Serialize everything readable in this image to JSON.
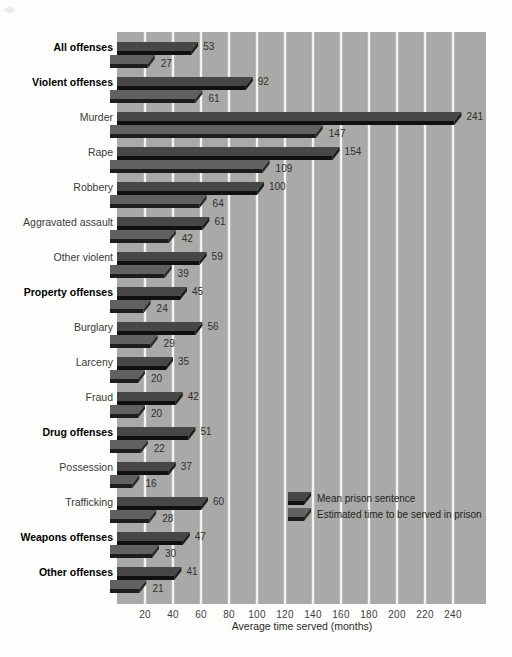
{
  "chart_data": {
    "type": "bar",
    "orientation": "horizontal",
    "title": "",
    "xlabel": "Average time served (months)",
    "x_ticks": [
      20,
      40,
      60,
      80,
      100,
      120,
      140,
      160,
      180,
      200,
      220,
      240
    ],
    "xlim": [
      0,
      264
    ],
    "grid": {
      "axis": "x",
      "style": "white vertical gridlines on gray panel"
    },
    "legend": {
      "position": "inside-right",
      "entries": [
        "Mean prison sentence",
        "Estimated time to be served in prison"
      ]
    },
    "categories": [
      "All offenses",
      "Violent offenses",
      "Murder",
      "Rape",
      "Robbery",
      "Aggravated assault",
      "Other violent",
      "Property offenses",
      "Burglary",
      "Larceny",
      "Fraud",
      "Drug offenses",
      "Possession",
      "Trafficking",
      "Weapons offenses",
      "Other offenses"
    ],
    "bold": [
      true,
      true,
      false,
      false,
      false,
      false,
      false,
      true,
      false,
      false,
      false,
      true,
      false,
      false,
      true,
      true
    ],
    "series": [
      {
        "name": "Mean prison sentence",
        "values": [
          53,
          92,
          241,
          154,
          100,
          61,
          59,
          45,
          56,
          35,
          42,
          51,
          37,
          60,
          47,
          41
        ]
      },
      {
        "name": "Estimated time to be served in prison",
        "values": [
          27,
          61,
          147,
          109,
          64,
          42,
          39,
          24,
          29,
          20,
          20,
          22,
          16,
          28,
          30,
          21
        ]
      }
    ],
    "colors": {
      "page_bg": "#fdfdfb",
      "plot_bg": "#a9a9a7",
      "gridline": "#f3f3f0",
      "sentence_bar": {
        "top": "#474747",
        "front": "#101010",
        "side": "#1c1c1c"
      },
      "served_bar": {
        "top": "#616161",
        "front": "#1d1d1d",
        "side": "#2a2a2a"
      },
      "value_text": "#2f2f2f"
    }
  }
}
